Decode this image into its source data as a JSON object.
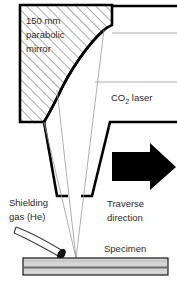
{
  "figure": {
    "type": "schematic-diagram",
    "width": 177,
    "height": 292,
    "background_color": "#ffffff"
  },
  "labels": {
    "mirror_line1": "150 mm",
    "mirror_line2": "parabolic",
    "mirror_line3": "mirror",
    "laser_main": "CO",
    "laser_sub": "2",
    "laser_tail": " laser",
    "shielding_line1": "Shielding",
    "shielding_line2": "gas (He)",
    "traverse_line1": "Traverse",
    "traverse_line2": "direction",
    "specimen": "Specimen"
  },
  "colors": {
    "outline": "#000000",
    "text": "#2b2b2b",
    "ray": "#8a8a8a",
    "beam": "#9a9a9a",
    "hatch": "#555555",
    "specimen_fill": "#d2d2d2",
    "specimen_band": "#6f6f6f",
    "arrow_fill": "#000000",
    "background": "#ffffff"
  },
  "geometry": {
    "mirror_block": {
      "left": 20,
      "top": 5,
      "right": 112,
      "bottom": 122,
      "step_right_x": 112,
      "step_y": 25,
      "hatch_angle_deg": 45
    },
    "parabolic_curve": {
      "top_point": [
        104,
        30
      ],
      "bottom_point": [
        44,
        122
      ],
      "bulge": "convex-right"
    },
    "incoming_rays_y": [
      11,
      33,
      82
    ],
    "focal_point": [
      76,
      258
    ],
    "nozzle_left_wall": {
      "top": [
        44,
        122
      ],
      "bottom": [
        57,
        196
      ]
    },
    "nozzle_right_wall": {
      "top": [
        110,
        122
      ],
      "bottom": [
        92,
        196
      ]
    },
    "traverse_arrow": {
      "x": 112,
      "y": 148,
      "width": 62,
      "height": 38
    },
    "specimen_bar": {
      "left": 23,
      "top": 258,
      "right": 168,
      "bottom": 275,
      "band_y": 268
    },
    "gas_tube": {
      "start": [
        18,
        228
      ],
      "end": [
        68,
        256
      ],
      "tip_angle_deg": 32
    }
  }
}
